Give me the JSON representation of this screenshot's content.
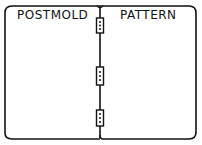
{
  "diagram": {
    "left_panel": {
      "label": "POSTMOLD"
    },
    "right_panel": {
      "label": "PATTERN"
    },
    "hinges": [
      {
        "name": "top-hinge"
      },
      {
        "name": "middle-hinge"
      },
      {
        "name": "bottom-hinge"
      }
    ],
    "colors": {
      "stroke": "#111111",
      "background": "#ffffff"
    }
  }
}
